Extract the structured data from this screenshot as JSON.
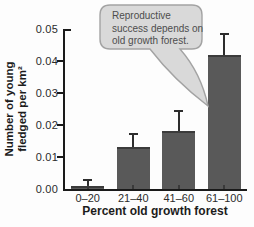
{
  "figure": {
    "callout": {
      "lines": [
        "Reproductive",
        "success depends on",
        "old growth forest."
      ],
      "text": "Reproductive success depends on old growth forest."
    }
  },
  "chart_data": {
    "type": "bar",
    "categories": [
      "0–20",
      "21–40",
      "41–60",
      "61–100"
    ],
    "values": [
      0.001,
      0.013,
      0.018,
      0.042
    ],
    "errors_upper": [
      0.0015,
      0.004,
      0.006,
      0.006
    ],
    "title": "",
    "xlabel": "Percent old growth forest",
    "ylabel": "Number of young fledged per km²",
    "ylabel_lines": [
      "Number of young",
      "fledged per km²"
    ],
    "ylim": [
      0,
      0.05
    ],
    "yticks": [
      "0.00",
      "0.01",
      "0.02",
      "0.03",
      "0.04",
      "0.05"
    ],
    "grid": false,
    "legend": "none",
    "annotation": "Reproductive success depends on old growth forest.",
    "colors": {
      "bar": "#595959",
      "bar_top_edge": "#3b3b3b",
      "axis": "#1a1a1a",
      "callout_fill": "#d9d9d9",
      "callout_border": "#a3a3a3"
    }
  }
}
